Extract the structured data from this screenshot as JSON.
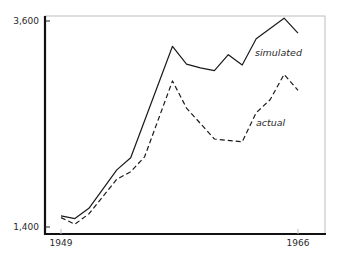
{
  "chart_data": {
    "type": "line",
    "title": "",
    "xlabel": "",
    "ylabel": "",
    "xlim": [
      1948,
      1968
    ],
    "ylim": [
      1400,
      3600
    ],
    "grid": false,
    "legend": "none",
    "x_ticks": [
      1949,
      1966
    ],
    "x_tick_labels": [
      "1949",
      "1966"
    ],
    "y_ticks": [
      1400,
      3600
    ],
    "y_tick_labels": [
      "1,400",
      "3,600"
    ],
    "series": [
      {
        "name": "simulated",
        "style": "solid",
        "color": "#1a1a1a",
        "x": [
          1949,
          1950,
          1951,
          1953,
          1954,
          1957,
          1958,
          1959,
          1960,
          1961,
          1962,
          1963,
          1965,
          1966
        ],
        "values": [
          1520,
          1490,
          1600,
          2010,
          2140,
          3330,
          3140,
          3100,
          3070,
          3240,
          3130,
          3410,
          3630,
          3470
        ]
      },
      {
        "name": "actual",
        "style": "dashed",
        "color": "#1a1a1a",
        "x": [
          1949,
          1950,
          1951,
          1953,
          1954,
          1955,
          1957,
          1958,
          1960,
          1962,
          1963,
          1964,
          1965,
          1966
        ],
        "values": [
          1500,
          1430,
          1540,
          1910,
          1990,
          2150,
          2960,
          2670,
          2340,
          2310,
          2620,
          2760,
          3030,
          2860
        ]
      }
    ],
    "annotations": [
      {
        "text": "simulated",
        "series": "simulated"
      },
      {
        "text": "actual",
        "series": "actual"
      }
    ]
  }
}
